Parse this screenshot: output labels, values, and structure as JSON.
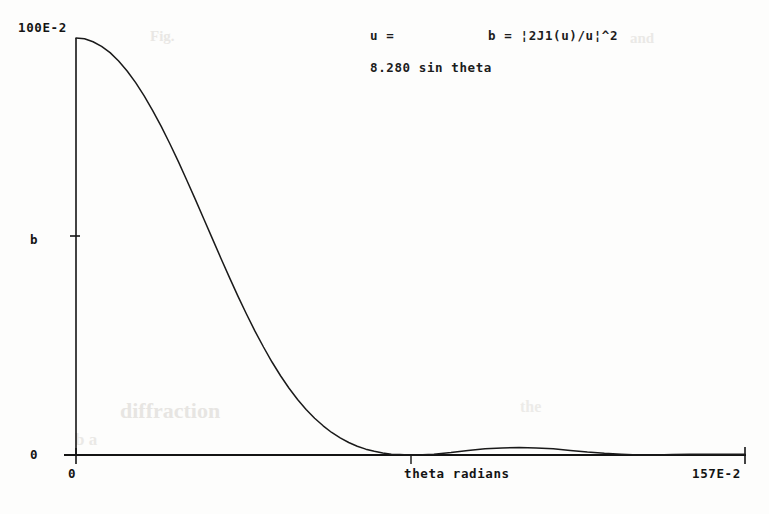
{
  "figure": {
    "annotations": {
      "u_label": "u =",
      "u_value": "8.280 sin theta",
      "formula": "b = ¦2J1(u)/u¦^2"
    },
    "axes": {
      "y_top_label": "100E-2",
      "y_mid_label": "b",
      "y_zero_label": "0",
      "x_zero_label": "0",
      "x_max_label": "157E-2",
      "x_title": "theta radians"
    },
    "colors": {
      "background": "#fdfdfc",
      "ink": "#141414",
      "curve": "#1a1a1a",
      "bleed_through": "#d9d6d2"
    },
    "bleed_through_text": [
      "Fig.",
      "and",
      "diffraction",
      "b a",
      "the"
    ]
  },
  "chart_data": {
    "type": "line",
    "title": "",
    "subtitle": "",
    "xlabel": "theta radians",
    "ylabel": "b",
    "xlim": [
      0,
      1.57
    ],
    "ylim": [
      0,
      1.0
    ],
    "x_tick_labels": [
      "0",
      "157E-2"
    ],
    "y_tick_labels": [
      "0",
      "100E-2"
    ],
    "grid": false,
    "legend": null,
    "equation": "b = |2*J1(u)/u|^2,  u = 8.280 * sin(theta)",
    "series": [
      {
        "name": "b = |2J1(u)/u|^2",
        "x": [
          0.0,
          0.02,
          0.04,
          0.06,
          0.08,
          0.1,
          0.12,
          0.14,
          0.16,
          0.18,
          0.2,
          0.22,
          0.24,
          0.26,
          0.28,
          0.3,
          0.32,
          0.34,
          0.36,
          0.38,
          0.4,
          0.42,
          0.44,
          0.46,
          0.48,
          0.5,
          0.52,
          0.54,
          0.56,
          0.58,
          0.6,
          0.62,
          0.64,
          0.66,
          0.68,
          0.7,
          0.72,
          0.74,
          0.76,
          0.78,
          0.8,
          0.84,
          0.88,
          0.92,
          0.96,
          1.0,
          1.04,
          1.08,
          1.12,
          1.16,
          1.2,
          1.24,
          1.28,
          1.32,
          1.36,
          1.4,
          1.44,
          1.48,
          1.52,
          1.57
        ],
        "y": [
          1.0,
          0.998,
          0.991,
          0.98,
          0.965,
          0.945,
          0.921,
          0.893,
          0.861,
          0.826,
          0.788,
          0.747,
          0.704,
          0.659,
          0.613,
          0.566,
          0.519,
          0.472,
          0.426,
          0.381,
          0.338,
          0.297,
          0.259,
          0.223,
          0.19,
          0.16,
          0.133,
          0.109,
          0.088,
          0.07,
          0.054,
          0.041,
          0.03,
          0.021,
          0.014,
          0.009,
          0.005,
          0.002,
          0.001,
          0.0,
          0.0,
          0.002,
          0.006,
          0.011,
          0.015,
          0.017,
          0.018,
          0.017,
          0.015,
          0.011,
          0.007,
          0.004,
          0.002,
          0.0,
          0.0,
          0.001,
          0.002,
          0.002,
          0.002,
          0.002
        ]
      }
    ],
    "features": {
      "central_peak_value": 1.0,
      "first_zero_theta": 0.79,
      "second_lobe_peak_theta": 1.04,
      "second_lobe_peak_value": 0.018
    }
  }
}
